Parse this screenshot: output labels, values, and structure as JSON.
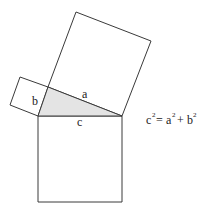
{
  "diagram": {
    "labels": {
      "a": "a",
      "b": "b",
      "c": "c"
    },
    "formula": {
      "c": "c",
      "eq": " = ",
      "a": "a",
      "plus": " + ",
      "b": "b",
      "exp": "2"
    },
    "colors": {
      "stroke": "#3a3a3a",
      "triangle_fill": "#e4e4e4",
      "background": "#ffffff"
    }
  }
}
